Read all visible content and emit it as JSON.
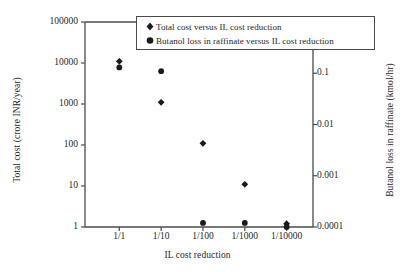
{
  "chart_data": {
    "type": "scatter",
    "title": "",
    "xlabel": "IL cost reduction",
    "categories": [
      "1/1",
      "1/10",
      "1/100",
      "1/1000",
      "1/10000"
    ],
    "x_tick_labels": [
      "1/1",
      "1/10",
      "1/100",
      "1/1000",
      "1/10000"
    ],
    "grid": false,
    "legend_position": "top-center",
    "axes": {
      "left": {
        "label": "Total cost (crore INR/year)",
        "scale": "log",
        "lim": [
          1,
          100000
        ],
        "ticks": [
          1,
          10,
          100,
          1000,
          10000,
          100000
        ],
        "tick_labels": [
          "1",
          "10",
          "100",
          "1000",
          "10000",
          "100000"
        ]
      },
      "right": {
        "label": "Butanol loss in raffinate (kmol/hr)",
        "scale": "log",
        "lim": [
          0.0001,
          1
        ],
        "ticks": [
          0.0001,
          0.001,
          0.01,
          0.1,
          1
        ],
        "tick_labels": [
          "0.0001",
          "0.001",
          "0.01",
          "0.1",
          "1"
        ]
      }
    },
    "series": [
      {
        "name": "Total cost versus IL cost reduction",
        "marker": "diamond",
        "axis": "left",
        "color": "#1a1a1a",
        "x": [
          "1/1",
          "1/10",
          "1/100",
          "1/1000",
          "1/10000"
        ],
        "values": [
          11000,
          1100,
          110,
          11,
          1.2
        ]
      },
      {
        "name": "Butanol loss in raffinate versus IL cost reduction",
        "marker": "circle",
        "axis": "right",
        "color": "#1a1a1a",
        "x": [
          "1/1",
          "1/10",
          "1/100",
          "1/1000",
          "1/10000"
        ],
        "values": [
          0.13,
          0.11,
          0.00012,
          0.00012,
          0.0001
        ]
      }
    ]
  },
  "legend": {
    "items": [
      {
        "label": "Total cost versus IL cost reduction",
        "marker": "diamond"
      },
      {
        "label": "Butanol loss in raffinate versus IL cost reduction",
        "marker": "circle"
      }
    ]
  },
  "colors": {
    "marker": "#1a1a1a",
    "axis": "#4a4a4a",
    "text": "#1f1f1f",
    "background": "#ffffff"
  }
}
